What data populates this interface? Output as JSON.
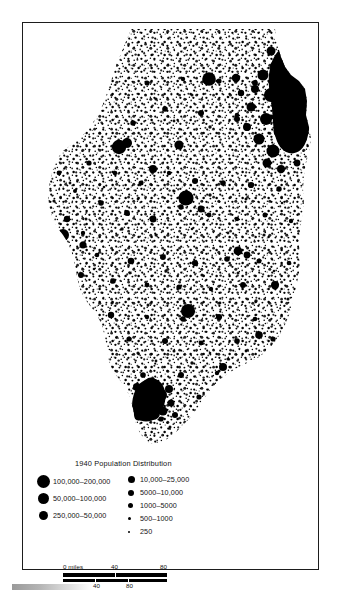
{
  "map": {
    "title": "1940 Population Distribution",
    "subject": "Illinois",
    "symbology": "dot-density / graduated circles",
    "dot_color": "#000000",
    "background_color": "#ffffff",
    "frame_color": "#1d1d1d"
  },
  "legend": {
    "title": "1940 Population Distribution",
    "left_column": [
      {
        "label": "100,000–200,000",
        "size_px": 13
      },
      {
        "label": "50,000–100,000",
        "size_px": 11
      },
      {
        "label": "250,000–50,000",
        "size_px": 9
      }
    ],
    "right_column": [
      {
        "label": "10,000–25,000",
        "size_px": 7
      },
      {
        "label": "5000–10,000",
        "size_px": 6
      },
      {
        "label": "1000–5000",
        "size_px": 5
      },
      {
        "label": "500–1000",
        "size_px": 3
      },
      {
        "label": "250",
        "size_px": 2
      }
    ]
  },
  "scale_bars": [
    {
      "unit_label": "0 miles",
      "ticks": [
        "0 miles",
        "40",
        "80"
      ],
      "values": [
        0,
        40,
        80
      ]
    },
    {
      "unit_label": "0 km",
      "ticks": [
        "0 km",
        "40",
        "80"
      ],
      "values": [
        0,
        40,
        80
      ]
    }
  ]
}
